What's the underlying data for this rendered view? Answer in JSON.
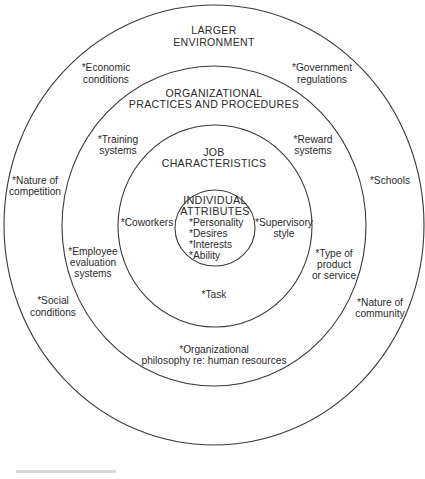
{
  "diagram": {
    "type": "concentric-circles",
    "rings": [
      {
        "id": "larger-environment",
        "title_lines": [
          "LARGER",
          "ENVIRONMENT"
        ],
        "factors": [
          {
            "lines": [
              "*Economic",
              "conditions"
            ]
          },
          {
            "lines": [
              "*Government",
              "regulations"
            ]
          },
          {
            "lines": [
              "*Nature of",
              "competition"
            ]
          },
          {
            "lines": [
              "*Schools"
            ]
          },
          {
            "lines": [
              "*Social",
              "conditions"
            ]
          },
          {
            "lines": [
              "*Nature of",
              "community"
            ]
          }
        ]
      },
      {
        "id": "organizational-practices",
        "title_lines": [
          "ORGANIZATIONAL",
          "PRACTICES AND PROCEDURES"
        ],
        "factors": [
          {
            "lines": [
              "*Training",
              "systems"
            ]
          },
          {
            "lines": [
              "*Reward",
              "systems"
            ]
          },
          {
            "lines": [
              "*Employee",
              "evaluation",
              "systems"
            ]
          },
          {
            "lines": [
              "*Type of",
              "product",
              "or service"
            ]
          },
          {
            "lines": [
              "*Organizational",
              "philosophy re: human resources"
            ]
          }
        ]
      },
      {
        "id": "job-characteristics",
        "title_lines": [
          "JOB",
          "CHARACTERISTICS"
        ],
        "factors": [
          {
            "lines": [
              "*Coworkers"
            ]
          },
          {
            "lines": [
              "*Supervisory",
              "style"
            ]
          },
          {
            "lines": [
              "*Task"
            ]
          }
        ]
      },
      {
        "id": "individual-attributes",
        "title_lines": [
          "INDIVIDUAL",
          "ATTRIBUTES"
        ],
        "factors": [
          {
            "lines": [
              "*Personality"
            ]
          },
          {
            "lines": [
              "*Desires"
            ]
          },
          {
            "lines": [
              "*Interests"
            ]
          },
          {
            "lines": [
              "*Ability"
            ]
          }
        ]
      }
    ]
  },
  "colors": {
    "background": "#ffffff",
    "line": "#3a3a3a",
    "text": "#2b2b2b"
  }
}
